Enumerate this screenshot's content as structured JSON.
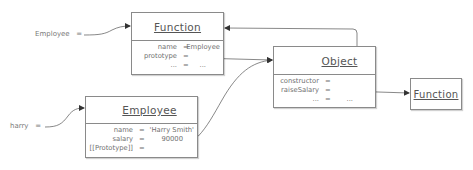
{
  "diagram": {
    "variables": [
      {
        "name": "Employee",
        "op": "="
      },
      {
        "name": "harry",
        "op": "="
      }
    ],
    "boxes": {
      "function_employee": {
        "title": "Function",
        "rows": [
          {
            "key": "name",
            "op": "=",
            "value": "Employee"
          },
          {
            "key": "prototype",
            "op": "=",
            "value": ""
          },
          {
            "key": "...",
            "op": "=",
            "value": "..."
          }
        ]
      },
      "object_prototype": {
        "title": "Object",
        "rows": [
          {
            "key": "constructor",
            "op": "=",
            "value": ""
          },
          {
            "key": "raiseSalary",
            "op": "=",
            "value": ""
          },
          {
            "key": "...",
            "op": "=",
            "value": "..."
          }
        ]
      },
      "function_raise": {
        "title": "Function"
      },
      "employee_harry": {
        "title": "Employee",
        "rows": [
          {
            "key": "name",
            "op": "=",
            "value": "'Harry Smith'"
          },
          {
            "key": "salary",
            "op": "=",
            "value": "90000"
          },
          {
            "key": "[[Prototype]]",
            "op": "=",
            "value": ""
          }
        ]
      }
    },
    "arrows": [
      {
        "from": "Employee variable",
        "to": "Function box"
      },
      {
        "from": "Function.prototype",
        "to": "Object box"
      },
      {
        "from": "Object.constructor",
        "to": "Function box"
      },
      {
        "from": "Object.raiseSalary",
        "to": "Function (raiseSalary) box"
      },
      {
        "from": "harry variable",
        "to": "Employee box"
      },
      {
        "from": "Employee.[[Prototype]]",
        "to": "Object box"
      }
    ],
    "colors": {
      "line": "#555555",
      "border": "#8a8a8a",
      "text": "#6a6a6a"
    }
  }
}
